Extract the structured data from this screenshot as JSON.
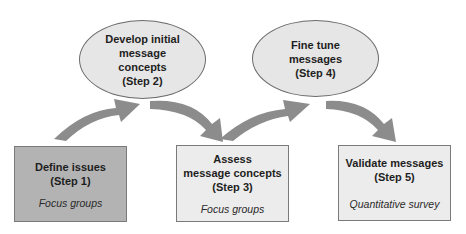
{
  "colors": {
    "arrow": "#8c8c8c",
    "ellipse_fill": "#e6e6e6",
    "box_dark_fill": "#b3b3b3",
    "box_light_fill": "#ececec",
    "outline": "#6b6b6b"
  },
  "steps": [
    {
      "step": 1,
      "shape": "box",
      "title": "Define issues\n(Step 1)",
      "method": "Focus groups",
      "fill": "#b3b3b3"
    },
    {
      "step": 2,
      "shape": "ellipse",
      "title": "Develop initial\nmessage\nconcepts\n(Step 2)"
    },
    {
      "step": 3,
      "shape": "box",
      "title": "Assess\nmessage concepts\n(Step 3)",
      "method": "Focus groups",
      "fill": "#ececec"
    },
    {
      "step": 4,
      "shape": "ellipse",
      "title": "Fine tune\nmessages\n(Step 4)"
    },
    {
      "step": 5,
      "shape": "box",
      "title": "Validate messages\n(Step 5)",
      "method": "Quantitative survey",
      "fill": "#ececec"
    }
  ],
  "arrows": [
    {
      "from": 1,
      "to": 2,
      "direction": "up"
    },
    {
      "from": 2,
      "to": 3,
      "direction": "down"
    },
    {
      "from": 3,
      "to": 4,
      "direction": "up"
    },
    {
      "from": 4,
      "to": 5,
      "direction": "down"
    }
  ]
}
